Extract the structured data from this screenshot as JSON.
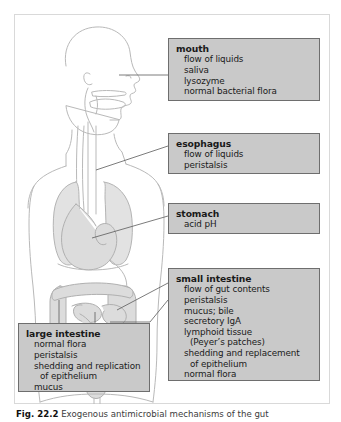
{
  "figure": {
    "caption_label": "Fig. 22.2",
    "caption_text": "Exogenous antimicrobial mechanisms of the gut"
  },
  "anatomy": {
    "alt": "line drawing of human torso in profile showing digestive tract",
    "parts": [
      "head-profile",
      "oral-cavity",
      "pharynx",
      "trachea",
      "esophagus",
      "lungs",
      "stomach",
      "small-intestine",
      "large-intestine",
      "rectum"
    ],
    "line_color": "#b4b4b4",
    "organ_fill": "#dcdcdc"
  },
  "boxes": [
    {
      "id": "mouth",
      "header": "mouth",
      "lines": [
        {
          "text": "flow of liquids",
          "sub": false
        },
        {
          "text": "saliva",
          "sub": false
        },
        {
          "text": "lysozyme",
          "sub": false
        },
        {
          "text": "normal bacterial flora",
          "sub": false
        }
      ]
    },
    {
      "id": "esophagus",
      "header": "esophagus",
      "lines": [
        {
          "text": "flow of liquids",
          "sub": false
        },
        {
          "text": "peristalsis",
          "sub": false
        }
      ]
    },
    {
      "id": "stomach",
      "header": "stomach",
      "lines": [
        {
          "text": "acid pH",
          "sub": false
        }
      ]
    },
    {
      "id": "small-intestine",
      "header": "small intestine",
      "lines": [
        {
          "text": "flow of gut contents",
          "sub": false
        },
        {
          "text": "peristalsis",
          "sub": false
        },
        {
          "text": "mucus; bile",
          "sub": false
        },
        {
          "text": "secretory IgA",
          "sub": false
        },
        {
          "text": "lymphoid tissue",
          "sub": false
        },
        {
          "text": "(Peyer’s patches)",
          "sub": true
        },
        {
          "text": "shedding and replacement",
          "sub": false
        },
        {
          "text": "of epithelium",
          "sub": true
        },
        {
          "text": "normal flora",
          "sub": false
        }
      ]
    },
    {
      "id": "large-intestine",
      "header": "large intestine",
      "lines": [
        {
          "text": "normal flora",
          "sub": false
        },
        {
          "text": "peristalsis",
          "sub": false
        },
        {
          "text": "shedding and replication",
          "sub": false
        },
        {
          "text": "of epithelium",
          "sub": true
        },
        {
          "text": "mucus",
          "sub": false
        }
      ]
    }
  ],
  "colors": {
    "box_fill": "#c9c9c9",
    "box_border": "#6e6e6e",
    "frame_border": "#d9d9d9",
    "leader_line": "#5a5a5a",
    "background": "#ffffff",
    "text": "#1a1a1a"
  }
}
